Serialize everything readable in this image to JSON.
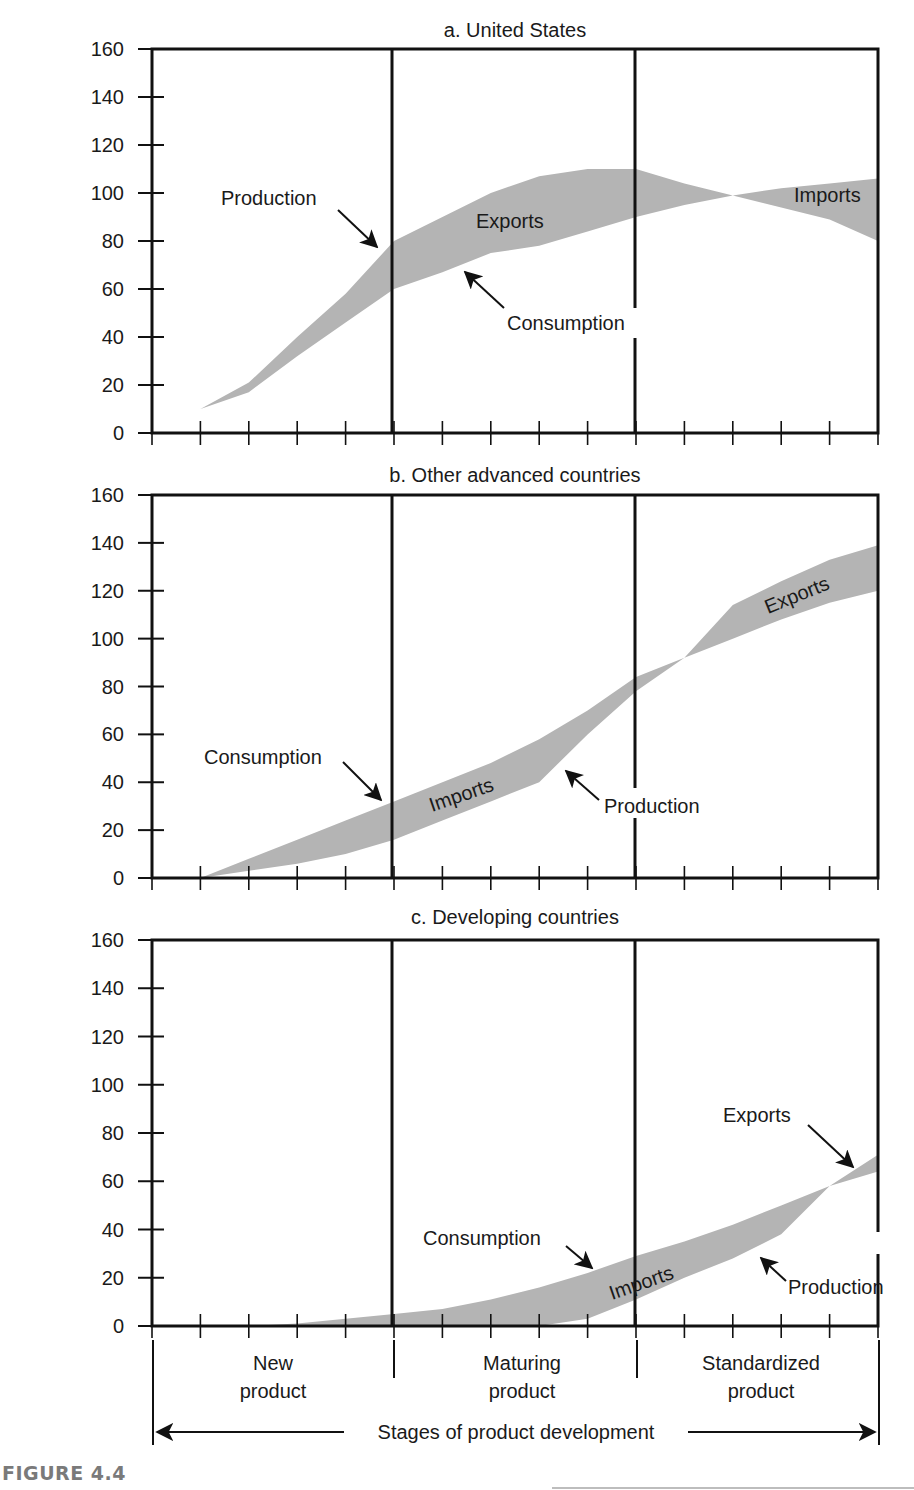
{
  "figure_label": "FIGURE 4.4",
  "x_axis": {
    "title": "Stages of product development",
    "stages": [
      {
        "line1": "New",
        "line2": "product"
      },
      {
        "line1": "Maturing",
        "line2": "product"
      },
      {
        "line1": "Standardized",
        "line2": "product"
      }
    ],
    "tick_count": 16
  },
  "y_axis": {
    "ticks": [
      "0",
      "20",
      "40",
      "60",
      "80",
      "100",
      "120",
      "140",
      "160"
    ]
  },
  "colors": {
    "band_fill": "#b4b4b4",
    "axis": "#111111",
    "caption": "#7a7a7a"
  },
  "chart_data": [
    {
      "type": "area",
      "title": "a. United States",
      "xlabel": "Stages of product development",
      "ylabel": "",
      "ylim": [
        0,
        160
      ],
      "x": [
        0,
        1,
        2,
        3,
        4,
        5,
        6,
        7,
        8,
        9,
        10,
        11,
        12,
        13,
        14,
        15
      ],
      "series": [
        {
          "name": "Production",
          "values": [
            0,
            10,
            21,
            40,
            58,
            80,
            90,
            100,
            107,
            110,
            110,
            104,
            99,
            102,
            104,
            106
          ]
        },
        {
          "name": "Consumption",
          "values": [
            0,
            10,
            17,
            32,
            46,
            60,
            67,
            75,
            78,
            84,
            90,
            95,
            99,
            94,
            89,
            80
          ]
        }
      ],
      "bands": [
        {
          "label": "Exports",
          "from_tick": 0,
          "to_tick": 12
        },
        {
          "label": "Imports",
          "from_tick": 12,
          "to_tick": 15
        }
      ],
      "annotations": [
        {
          "text": "Production",
          "arrow_to": "production at tick 5"
        },
        {
          "text": "Consumption",
          "arrow_to": "consumption at tick 6.5"
        },
        {
          "text": "Exports",
          "inside_band": true
        },
        {
          "text": "Imports",
          "inside_band": true
        }
      ],
      "stage_dividers_at_ticks": [
        5,
        10
      ]
    },
    {
      "type": "area",
      "title": "b. Other advanced countries",
      "xlabel": "Stages of product development",
      "ylabel": "",
      "ylim": [
        0,
        160
      ],
      "x": [
        0,
        1,
        2,
        3,
        4,
        5,
        6,
        7,
        8,
        9,
        10,
        11,
        12,
        13,
        14,
        15
      ],
      "series": [
        {
          "name": "Consumption",
          "values": [
            0,
            0,
            8,
            16,
            24,
            32,
            40,
            48,
            58,
            70,
            84,
            92,
            114,
            124,
            133,
            139
          ]
        },
        {
          "name": "Production",
          "values": [
            0,
            0,
            3,
            6,
            10,
            16,
            24,
            32,
            40,
            60,
            78,
            92,
            100,
            108,
            115,
            120
          ]
        }
      ],
      "bands": [
        {
          "label": "Imports",
          "from_tick": 1,
          "to_tick": 11
        },
        {
          "label": "Exports",
          "from_tick": 11,
          "to_tick": 15
        }
      ],
      "annotations": [
        {
          "text": "Consumption",
          "arrow_to": "consumption at tick 5"
        },
        {
          "text": "Production",
          "arrow_to": "production at tick 8"
        },
        {
          "text": "Imports",
          "inside_band": true
        },
        {
          "text": "Exports",
          "inside_band": true
        }
      ],
      "stage_dividers_at_ticks": [
        5,
        10
      ]
    },
    {
      "type": "area",
      "title": "c. Developing countries",
      "xlabel": "Stages of product development",
      "ylabel": "",
      "ylim": [
        0,
        160
      ],
      "x": [
        0,
        1,
        2,
        3,
        4,
        5,
        6,
        7,
        8,
        9,
        10,
        11,
        12,
        13,
        14,
        15
      ],
      "series": [
        {
          "name": "Consumption",
          "values": [
            0,
            0,
            0,
            1,
            3,
            5,
            7,
            11,
            16,
            22,
            29,
            35,
            42,
            50,
            58,
            64
          ]
        },
        {
          "name": "Production",
          "values": [
            0,
            0,
            0,
            0,
            0,
            0,
            0,
            0,
            0,
            3,
            11,
            20,
            28,
            38,
            58,
            71
          ]
        }
      ],
      "bands": [
        {
          "label": "Imports",
          "from_tick": 2,
          "to_tick": 14
        },
        {
          "label": "Exports",
          "from_tick": 14,
          "to_tick": 15
        }
      ],
      "annotations": [
        {
          "text": "Consumption",
          "arrow_to": "consumption at tick 9"
        },
        {
          "text": "Imports",
          "inside_band": true
        },
        {
          "text": "Exports",
          "arrow_to": "band at tick 14.5"
        },
        {
          "text": "Production",
          "arrow_to": "production at tick 12.5"
        }
      ],
      "stage_dividers_at_ticks": [
        5,
        10
      ]
    }
  ],
  "labels": {
    "production": "Production",
    "consumption": "Consumption",
    "exports": "Exports",
    "imports": "Imports"
  }
}
